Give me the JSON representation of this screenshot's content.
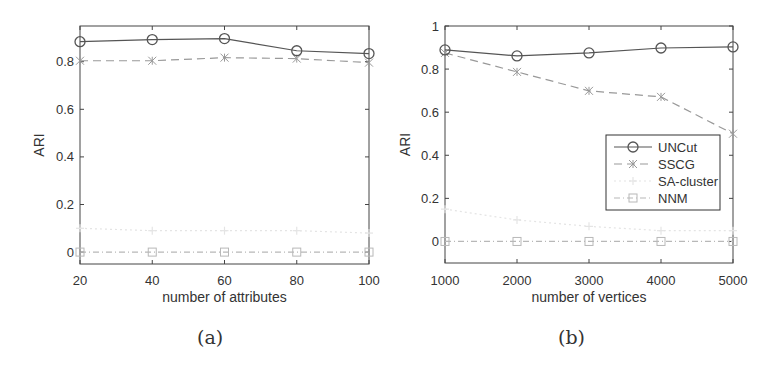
{
  "chart_data": [
    {
      "id": "a",
      "type": "line",
      "caption": "(a)",
      "title": "",
      "xlabel": "number of attributes",
      "ylabel": "ARI",
      "x": [
        20,
        40,
        60,
        80,
        100
      ],
      "xticks": [
        "20",
        "40",
        "60",
        "80",
        "100"
      ],
      "yticks": [
        "0",
        "0.2",
        "0.4",
        "0.6",
        "0.8"
      ],
      "ytick_values": [
        0,
        0.2,
        0.4,
        0.6,
        0.8
      ],
      "xlim": [
        20,
        100
      ],
      "ylim": [
        -0.05,
        0.95
      ],
      "grid": false,
      "legend": false,
      "series": [
        {
          "name": "UNCut",
          "values": [
            0.884,
            0.893,
            0.897,
            0.846,
            0.834
          ],
          "color": "#555555",
          "dash": "",
          "marker": "circle"
        },
        {
          "name": "SSCG",
          "values": [
            0.804,
            0.804,
            0.817,
            0.813,
            0.796
          ],
          "color": "#999999",
          "dash": "8,5",
          "marker": "asterisk"
        },
        {
          "name": "SA-cluster",
          "values": [
            0.1,
            0.09,
            0.09,
            0.09,
            0.08
          ],
          "color": "#e4e4e4",
          "dash": "2,3",
          "marker": "plus"
        },
        {
          "name": "NNM",
          "values": [
            0.0,
            0.0,
            0.0,
            0.0,
            0.0
          ],
          "color": "#b8b8b8",
          "dash": "6,3,1,3",
          "marker": "square"
        }
      ]
    },
    {
      "id": "b",
      "type": "line",
      "caption": "(b)",
      "title": "",
      "xlabel": "number of vertices",
      "ylabel": "ARI",
      "x": [
        1000,
        2000,
        3000,
        4000,
        5000
      ],
      "xticks": [
        "1000",
        "2000",
        "3000",
        "4000",
        "5000"
      ],
      "yticks": [
        "0",
        "0.2",
        "0.4",
        "0.6",
        "0.8",
        "1"
      ],
      "ytick_values": [
        0,
        0.2,
        0.4,
        0.6,
        0.8,
        1.0
      ],
      "xlim": [
        1000,
        5000
      ],
      "ylim": [
        -0.1,
        1.0
      ],
      "grid": false,
      "legend": true,
      "legend_position": "center-right",
      "series": [
        {
          "name": "UNCut",
          "values": [
            0.889,
            0.861,
            0.875,
            0.898,
            0.903
          ],
          "color": "#555555",
          "dash": "",
          "marker": "circle"
        },
        {
          "name": "SSCG",
          "values": [
            0.875,
            0.787,
            0.699,
            0.671,
            0.5
          ],
          "color": "#999999",
          "dash": "8,5",
          "marker": "asterisk"
        },
        {
          "name": "SA-cluster",
          "values": [
            0.15,
            0.1,
            0.07,
            0.05,
            0.05
          ],
          "color": "#e4e4e4",
          "dash": "2,3",
          "marker": "plus"
        },
        {
          "name": "NNM",
          "values": [
            0.0,
            0.0,
            0.0,
            0.0,
            0.0
          ],
          "color": "#b8b8b8",
          "dash": "6,3,1,3",
          "marker": "square"
        }
      ]
    }
  ]
}
